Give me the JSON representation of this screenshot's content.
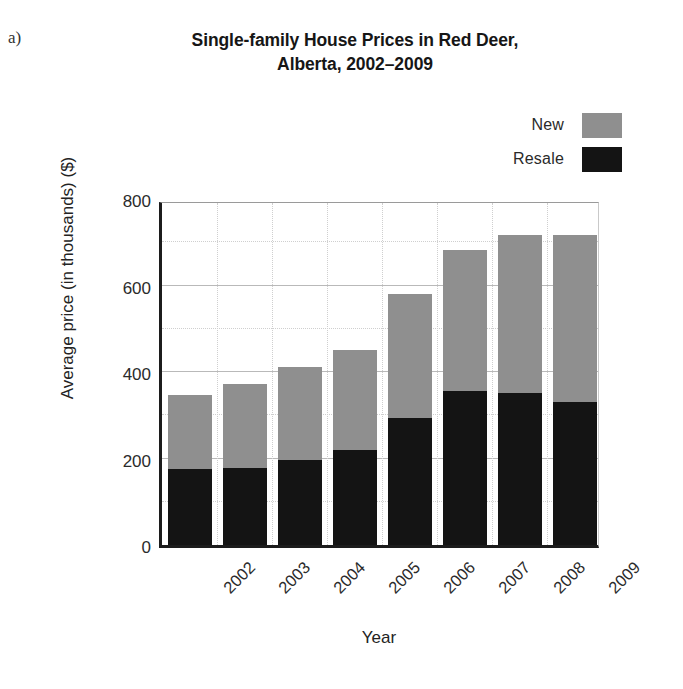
{
  "panel_label": "a)",
  "title": {
    "line1": "Single-family House Prices in Red Deer,",
    "line2": "Alberta, 2002–2009"
  },
  "legend": {
    "items": [
      {
        "label": "New",
        "color": "#8f8f8f"
      },
      {
        "label": "Resale",
        "color": "#141414"
      }
    ]
  },
  "axes": {
    "ylabel": "Average price (in thousands) ($)",
    "xlabel": "Year",
    "yticks": [
      "0",
      "200",
      "400",
      "600",
      "800"
    ]
  },
  "chart_data": {
    "type": "bar",
    "subtype": "stacked",
    "title": "Single-family House Prices in Red Deer, Alberta, 2002–2009",
    "xlabel": "Year",
    "ylabel": "Average price (in thousands) ($)",
    "categories": [
      "2002",
      "2003",
      "2004",
      "2005",
      "2006",
      "2007",
      "2008",
      "2009"
    ],
    "series": [
      {
        "name": "Resale",
        "color": "#141414",
        "values": [
          175,
          178,
          197,
          220,
          294,
          356,
          351,
          331
        ]
      },
      {
        "name": "New",
        "color": "#8f8f8f",
        "values": [
          173,
          194,
          215,
          231,
          287,
          326,
          366,
          386
        ]
      }
    ],
    "totals": [
      348,
      372,
      412,
      451,
      581,
      682,
      717,
      717
    ],
    "ylim": [
      0,
      800
    ],
    "ytick_step": 200,
    "gridline_step": 100,
    "grid": true,
    "legend_position": "top-right",
    "xtick_rotation": -45
  }
}
